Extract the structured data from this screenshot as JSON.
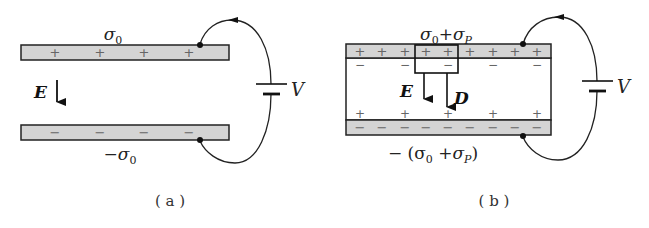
{
  "figure": {
    "panels": [
      {
        "id": "a",
        "caption": "( a )",
        "top_plate_label": "σ",
        "top_plate_label_sub": "0",
        "bottom_plate_label_prefix": "−σ",
        "bottom_plate_label_sub": "0",
        "field_label": "E",
        "battery_label": "V",
        "top_plate_charges": [
          "+",
          "+",
          "+",
          "+"
        ],
        "bottom_plate_charges": [
          "−",
          "−",
          "−",
          "−"
        ]
      },
      {
        "id": "b",
        "caption": "( b )",
        "top_plate_label": "σ",
        "top_plate_label_sub": "0",
        "top_plate_label_plus": "+σ",
        "top_plate_label_sub2": "P",
        "bottom_plate_label_prefix": "− (σ",
        "bottom_plate_label_sub": "0",
        "bottom_plate_label_mid": " +σ",
        "bottom_plate_label_sub2": "P",
        "bottom_plate_label_suffix": ")",
        "field_label": "E",
        "displacement_label": "D",
        "battery_label": "V",
        "top_plate_charges": [
          "+",
          "+",
          "+",
          "+",
          "+",
          "+",
          "+",
          "+",
          "+"
        ],
        "bottom_plate_charges": [
          "−",
          "−",
          "−",
          "−",
          "−",
          "−",
          "−",
          "−",
          "−"
        ],
        "dielectric_top_charges": [
          "−",
          "−",
          "−",
          "−",
          "−"
        ],
        "dielectric_bottom_charges": [
          "+",
          "+",
          "+",
          "+",
          "+"
        ]
      }
    ],
    "colors": {
      "plate_fill": "#d4d4d4",
      "stroke": "#222222",
      "background": "#ffffff"
    }
  }
}
